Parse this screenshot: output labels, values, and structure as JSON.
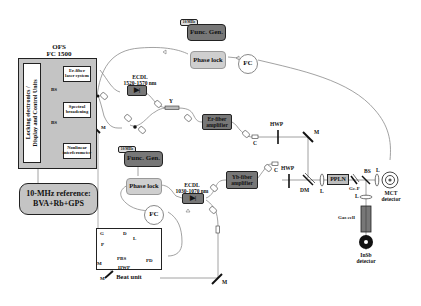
{
  "ofs": {
    "title_line1": "OFS",
    "title_line2": "FC 1500",
    "side_panel_line1": "Locking electronics /",
    "side_panel_line2": "Display and Control Units",
    "modules": [
      {
        "label": "Er-fiber laser system"
      },
      {
        "label": "Spectral broadening"
      },
      {
        "label": "Nonlinear interferometer"
      }
    ],
    "bs_labels": [
      "BS",
      "BS"
    ],
    "mirror_label": "M"
  },
  "reference": {
    "line1": "10-MHz reference:",
    "line2": "BVA+Rb+GPS"
  },
  "upper_branch": {
    "func_gen_tag": "10 MHz",
    "func_gen": "Func. Gen.",
    "phase_lock": "Phase lock",
    "fc": "FC",
    "ecdl_line1": "ECDL",
    "ecdl_line2": "1520-1570  nm",
    "coupler_label": "Y",
    "amplifier_line1": "Er-fiber",
    "amplifier_line2": "amplifier",
    "collimator": "C",
    "hwp": "HWP",
    "mirror": "M"
  },
  "lower_branch": {
    "func_gen_tag": "10 MHz",
    "func_gen": "Func. Gen.",
    "phase_lock": "Phase lock",
    "fc": "FC",
    "ecdl_line1": "ECDL",
    "ecdl_line2": "1030-1070 nm",
    "amplifier_line1": "Yb-fiber",
    "amplifier_line2": "amplifier",
    "collimator": "C",
    "hwp": "HWP",
    "mirror": "M"
  },
  "dfg_stage": {
    "dm": "DM",
    "lens1": "L",
    "crystal": "PPLN",
    "filter": "Ge-F",
    "bs": "BS",
    "lens2": "L",
    "mct_line1": "MCT",
    "mct_line2": "detector",
    "lens3": "L",
    "gas_cell": "Gas cell",
    "insb_line1": "InSb",
    "insb_line2": "detector"
  },
  "beat_unit": {
    "title": "Beat unit",
    "g": "G",
    "d": "D",
    "l": "L",
    "p": "P",
    "m1": "M",
    "pbs": "PBS",
    "hwp": "HWP",
    "m2": "M",
    "pd": "PD"
  },
  "colors": {
    "box_fill_dark": "#777777",
    "box_fill_light": "#c4c4c4",
    "phase_lock_fill": "#cfcfcf",
    "fiber_line": "#8a8a8a",
    "outline": "#222222"
  }
}
